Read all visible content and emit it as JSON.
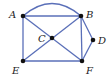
{
  "graph": {
    "edge_color": "#5a6fb8",
    "node_color": "#111111",
    "nodes": [
      {
        "id": "A",
        "label": "A",
        "x": 23,
        "y": 16,
        "lx": 9,
        "ly": 18
      },
      {
        "id": "B",
        "label": "B",
        "x": 81,
        "y": 16,
        "lx": 86,
        "ly": 18
      },
      {
        "id": "C",
        "label": "C",
        "x": 52,
        "y": 38,
        "lx": 38,
        "ly": 42
      },
      {
        "id": "D",
        "label": "D",
        "x": 93,
        "y": 40,
        "lx": 98,
        "ly": 44
      },
      {
        "id": "E",
        "label": "E",
        "x": 23,
        "y": 61,
        "lx": 12,
        "ly": 74
      },
      {
        "id": "F",
        "label": "F",
        "x": 82,
        "y": 61,
        "lx": 86,
        "ly": 74
      }
    ],
    "edges": [
      {
        "from": "A",
        "to": "B",
        "curved": true
      },
      {
        "from": "A",
        "to": "B",
        "curved": false
      },
      {
        "from": "A",
        "to": "E",
        "curved": false
      },
      {
        "from": "A",
        "to": "F",
        "curved": false
      },
      {
        "from": "B",
        "to": "E",
        "curved": false
      },
      {
        "from": "B",
        "to": "F",
        "curved": false
      },
      {
        "from": "B",
        "to": "D",
        "curved": false
      },
      {
        "from": "D",
        "to": "F",
        "curved": false
      },
      {
        "from": "E",
        "to": "F",
        "curved": false
      }
    ]
  }
}
